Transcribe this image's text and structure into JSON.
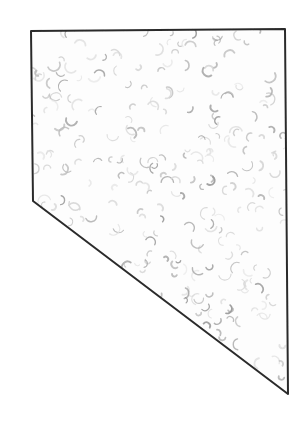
{
  "figure": {
    "title": "Nevada state outline",
    "subject": "Nevada",
    "caption": "",
    "background_color": "#ffffff",
    "canvas": {
      "width": 302,
      "height": 425
    }
  },
  "shape": {
    "name": "nevada-outline",
    "description": "Hand-drawn quadrilateral outline of the state of Nevada",
    "stroke_color": "#2b2b2b",
    "stroke_width": 2,
    "fill_color": "#fdfdfd",
    "vertices": [
      {
        "label": "northwest-corner",
        "x": 31,
        "y": 31
      },
      {
        "label": "northeast-corner",
        "x": 285,
        "y": 29
      },
      {
        "label": "southeast-tip",
        "x": 287,
        "y": 394
      },
      {
        "label": "west-bend",
        "x": 33,
        "y": 201
      }
    ],
    "path": "M31,31 L285,29 L288,394 L33,201 Z"
  },
  "texture": {
    "name": "crescent-stipple",
    "type": "scattered-crescents",
    "element_shape": "crescent",
    "count": 260,
    "colors": [
      "#d8d8d8",
      "#c9c9c9",
      "#bdbdbd",
      "#ababab",
      "#9c9c9c",
      "#e4e4e4"
    ],
    "min_size": 5,
    "max_size": 13,
    "seed": 20240815
  },
  "legend": {
    "visible": false,
    "entries": []
  },
  "labels": {
    "visible": false,
    "entries": []
  }
}
